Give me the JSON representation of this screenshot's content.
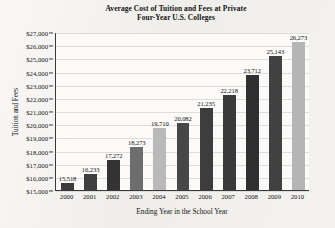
{
  "chart_data": {
    "type": "bar",
    "title": "Average Cost of Tuition and Fees at Private Four-Year U.S. Colleges",
    "title_lines": [
      "Average Cost of Tuition and Fees at Private",
      "Four-Year U.S. Colleges"
    ],
    "xlabel": "Ending Year in the School Year",
    "ylabel": "Tuition and Fees",
    "categories": [
      "2000",
      "2001",
      "2002",
      "2003",
      "2004",
      "2005",
      "2006",
      "2007",
      "2008",
      "2009",
      "2010"
    ],
    "values": [
      15518,
      16233,
      17272,
      18273,
      19710,
      20082,
      21235,
      22218,
      23712,
      25143,
      26273
    ],
    "value_labels": [
      "15,518",
      "16,233",
      "17,272",
      "18,273",
      "19,710",
      "20,082",
      "21,235",
      "22,218",
      "23,712",
      "25,143",
      "26,273"
    ],
    "bar_colors": [
      "#3b3b3b",
      "#3f3f3f",
      "#333333",
      "#6d6d6d",
      "#b9b9b9",
      "#474747",
      "#3d3d3d",
      "#3a3a3a",
      "#303030",
      "#414141",
      "#b5b5b5"
    ],
    "ylim": [
      15000,
      27000
    ],
    "ytick_values": [
      15000,
      16000,
      17000,
      18000,
      19000,
      20000,
      21000,
      22000,
      23000,
      24000,
      25000,
      26000,
      27000
    ],
    "ytick_labels": [
      "$15,000",
      "$16,000",
      "$17,000",
      "$18,000",
      "$19,000",
      "$20,000",
      "$21,000",
      "$22,000",
      "$23,000",
      "$24,000",
      "$25,000",
      "$26,000",
      "$27,000"
    ],
    "grid": true,
    "grid_axis": "y",
    "legend": null,
    "legend_position": "none",
    "plot_background": "#fbfaf8",
    "axis_color": "#3a3a3a",
    "gridline_color": "#dedcd7",
    "text_color": "#141414"
  }
}
